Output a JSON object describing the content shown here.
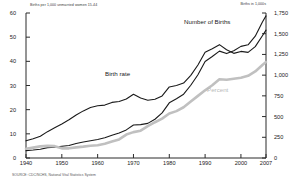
{
  "axes": {
    "left_title": "Births per 1,000 unmarried women 15-44",
    "right_title": "Births in 1,000s",
    "left_ticks": [
      "0",
      "10",
      "20",
      "30",
      "40",
      "50",
      "60"
    ],
    "right_ticks": [
      "0",
      "250",
      "500",
      "750",
      "1,000",
      "1,250",
      "1,500",
      "1,750"
    ],
    "x_ticks": [
      "1940",
      "1950",
      "1960",
      "1970",
      "1980",
      "1990",
      "2000",
      "2007"
    ]
  },
  "labels": {
    "birth_rate": "Birth rate",
    "number_of_births": "Number of Births",
    "percent": "Percent"
  },
  "source": "SOURCE: CDC/NCHS, National Vital Statistics System",
  "colors": {
    "line_dark": "#1a1a1a",
    "line_gray": "#c0c0c0",
    "axis": "#2b2b2b",
    "background": "#ffffff"
  },
  "chart_data": {
    "type": "line",
    "title": "",
    "xlabel": "",
    "ylabel": "Births per 1,000 unmarried women 15-44",
    "grid": false,
    "legend": "inline-annotations",
    "xlim": [
      1940,
      2007
    ],
    "ylim_left": [
      0,
      60
    ],
    "ylim_right": [
      0,
      1750
    ],
    "x": [
      1940,
      1942,
      1944,
      1946,
      1948,
      1950,
      1952,
      1954,
      1956,
      1958,
      1960,
      1962,
      1964,
      1966,
      1968,
      1970,
      1972,
      1974,
      1976,
      1978,
      1980,
      1982,
      1984,
      1986,
      1988,
      1990,
      1992,
      1994,
      1996,
      1998,
      2000,
      2002,
      2004,
      2006,
      2007
    ],
    "series": [
      {
        "name": "Birth rate",
        "axis": "left",
        "units": "births per 1,000 unmarried women aged 15-44",
        "color": "#1a1a1a",
        "values": [
          7.1,
          8.0,
          9.0,
          10.9,
          12.5,
          14.1,
          15.8,
          17.8,
          19.5,
          20.9,
          21.6,
          21.9,
          23.0,
          23.4,
          24.4,
          26.4,
          24.8,
          23.9,
          24.3,
          25.7,
          29.4,
          30.0,
          31.0,
          34.2,
          38.5,
          43.8,
          45.2,
          46.9,
          44.8,
          43.3,
          44.1,
          43.7,
          46.1,
          50.6,
          52.9
        ]
      },
      {
        "name": "Number of Births",
        "axis": "right",
        "units": "thousands of births to unmarried women",
        "color": "#1a1a1a",
        "values": [
          89,
          96,
          105,
          125,
          129,
          142,
          150,
          176,
          193,
          208,
          224,
          245,
          275,
          302,
          339,
          399,
          403,
          418,
          468,
          544,
          666,
          715,
          770,
          878,
          1005,
          1165,
          1225,
          1290,
          1260,
          1294,
          1347,
          1366,
          1470,
          1642,
          1715
        ]
      },
      {
        "name": "Percent",
        "axis": "right-scaled",
        "units": "percent of all births to unmarried women",
        "color": "#c0c0c0",
        "values": [
          3.8,
          4.3,
          4.8,
          5.0,
          4.9,
          4.0,
          4.0,
          4.4,
          4.7,
          5.1,
          5.3,
          5.9,
          6.8,
          7.7,
          9.7,
          10.7,
          11.3,
          13.2,
          14.8,
          16.3,
          18.4,
          19.4,
          21.0,
          23.4,
          25.7,
          28.0,
          30.1,
          32.6,
          32.4,
          32.8,
          33.2,
          34.0,
          35.8,
          38.5,
          39.7
        ]
      }
    ]
  }
}
